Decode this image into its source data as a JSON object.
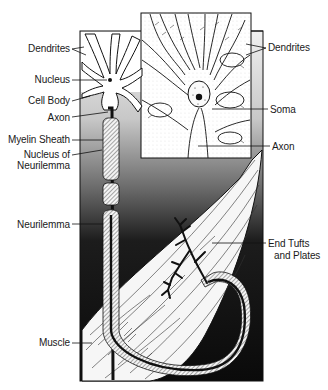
{
  "diagram": {
    "colors": {
      "ink": "#111111",
      "paper": "#ffffff",
      "bg_top": "#e2e2e2",
      "bg_bottom": "#0a0a0a"
    },
    "labels_left": [
      {
        "id": "dendrites",
        "text": "Dendrites",
        "x": 70,
        "y": 43
      },
      {
        "id": "nucleus",
        "text": "Nucleus",
        "x": 70,
        "y": 74
      },
      {
        "id": "cell-body",
        "text": "Cell Body",
        "x": 70,
        "y": 95
      },
      {
        "id": "axon",
        "text": "Axon",
        "x": 70,
        "y": 112
      },
      {
        "id": "myelin-sheath",
        "text": "Myelin Sheath",
        "x": 70,
        "y": 134
      },
      {
        "id": "nucleus-of",
        "text": "Nucleus of",
        "x": 70,
        "y": 149
      },
      {
        "id": "neurilemma-1",
        "text": "Neurilemma",
        "x": 70,
        "y": 160
      },
      {
        "id": "neurilemma-2",
        "text": "Neurilemma",
        "x": 70,
        "y": 219
      },
      {
        "id": "muscle",
        "text": "Muscle",
        "x": 70,
        "y": 337
      }
    ],
    "labels_right": [
      {
        "id": "dendrites-inset",
        "text": "Dendrites",
        "x": 268,
        "y": 42
      },
      {
        "id": "soma",
        "text": "Soma",
        "x": 270,
        "y": 104
      },
      {
        "id": "axon-inset",
        "text": "Axon",
        "x": 272,
        "y": 141
      },
      {
        "id": "end-tufts",
        "text": "End Tufts",
        "x": 268,
        "y": 238
      },
      {
        "id": "and-plates",
        "text": "and Plates",
        "x": 274,
        "y": 250
      }
    ]
  }
}
